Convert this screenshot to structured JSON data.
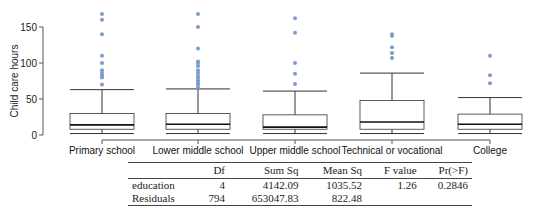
{
  "chart_data": {
    "type": "box",
    "title": "",
    "xlabel": "",
    "ylabel": "Child care hours",
    "ylim": [
      0,
      170
    ],
    "yticks": [
      0,
      50,
      100,
      150
    ],
    "grid": false,
    "categories": [
      "Primary school",
      "Lower middle school",
      "Upper middle school",
      "Technical or vocational",
      "College"
    ],
    "series": [
      {
        "name": "Primary school",
        "min": 2,
        "q1": 8,
        "median": 14,
        "q3": 30,
        "max": 63,
        "outliers": [
          70,
          80,
          83,
          86,
          90,
          100,
          110,
          140,
          160,
          168
        ]
      },
      {
        "name": "Lower middle school",
        "min": 2,
        "q1": 8,
        "median": 15,
        "q3": 30,
        "max": 64,
        "outliers": [
          66,
          70,
          73,
          76,
          80,
          82,
          86,
          90,
          96,
          100,
          102,
          120,
          150,
          168
        ]
      },
      {
        "name": "Upper middle school",
        "min": 2,
        "q1": 8,
        "median": 11,
        "q3": 28,
        "max": 61,
        "outliers": [
          71,
          85,
          100,
          142,
          162
        ]
      },
      {
        "name": "Technical or vocational",
        "min": 2,
        "q1": 8,
        "median": 18,
        "q3": 48,
        "max": 86,
        "outliers": [
          107,
          114,
          122,
          138,
          140
        ]
      },
      {
        "name": "College",
        "min": 2,
        "q1": 8,
        "median": 15,
        "q3": 29,
        "max": 52,
        "outliers": [
          72,
          83,
          110
        ]
      }
    ],
    "colors": {
      "outlier": "#7a9cd0",
      "box": "#333333",
      "axis": "#555555"
    }
  },
  "anova_table": {
    "columns": [
      "",
      "Df",
      "Sum Sq",
      "Mean Sq",
      "F value",
      "Pr(>F)"
    ],
    "rows": [
      [
        "education",
        "4",
        "4142.09",
        "1035.52",
        "1.26",
        "0.2846"
      ],
      [
        "Residuals",
        "794",
        "653047.83",
        "822.48",
        "",
        ""
      ]
    ]
  }
}
